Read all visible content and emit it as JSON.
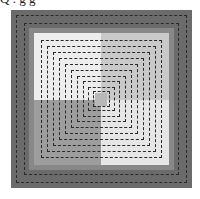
{
  "caption": "Q . g  g",
  "colors": {
    "outer_frame": "#6b6b6b",
    "ring": "#8a8a8a",
    "quad_tl": "#ededed",
    "quad_tr": "#c9c9c9",
    "quad_bl": "#9d9d9d",
    "quad_br": "#e6e6e6",
    "center_square": "#b8b8b8",
    "dash": "#2a2a2a"
  },
  "pattern": {
    "description": "Concentric dashed squares over a four-quadrant gray background",
    "outer_dashed_rings": 2,
    "inner_dashed_rings": 10
  }
}
